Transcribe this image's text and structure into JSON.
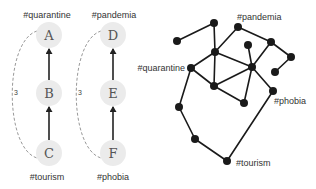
{
  "chains": [
    {
      "id": "left-chain",
      "distance_label": "3",
      "top_tag": "#quarantine",
      "bottom_tag": "#tourism",
      "nodes": [
        {
          "letter": "A",
          "x": 49,
          "y": 35
        },
        {
          "letter": "B",
          "x": 49,
          "y": 93
        },
        {
          "letter": "C",
          "x": 49,
          "y": 153
        }
      ],
      "tag_top_pos": {
        "x": 47,
        "y": 18
      },
      "tag_bottom_pos": {
        "x": 47,
        "y": 180
      },
      "dist_pos": {
        "x": 16,
        "y": 95
      },
      "arc": {
        "x_top": 37,
        "y_top": 31,
        "x_ctrl": 4,
        "y_mid": 93,
        "x_bottom": 37,
        "y_bottom": 158
      }
    },
    {
      "id": "right-chain",
      "distance_label": "3",
      "top_tag": "#pandemia",
      "bottom_tag": "#phobia",
      "nodes": [
        {
          "letter": "D",
          "x": 113,
          "y": 35
        },
        {
          "letter": "E",
          "x": 113,
          "y": 93
        },
        {
          "letter": "F",
          "x": 113,
          "y": 153
        }
      ],
      "tag_top_pos": {
        "x": 114,
        "y": 18
      },
      "tag_bottom_pos": {
        "x": 113,
        "y": 180
      },
      "dist_pos": {
        "x": 80,
        "y": 95
      },
      "arc": {
        "x_top": 101,
        "y_top": 31,
        "x_ctrl": 68,
        "y_mid": 93,
        "x_bottom": 101,
        "y_bottom": 158
      }
    }
  ],
  "node_style": {
    "fill": "#ebebeb",
    "radius": 13,
    "arrow_color": "#222222",
    "dash_color": "#999999"
  },
  "graph": {
    "node_radius": 4,
    "node_color": "#1a1a1a",
    "edge_color": "#1a1a1a",
    "nodes": [
      {
        "id": "n1",
        "x": 177,
        "y": 41
      },
      {
        "id": "n2",
        "x": 214,
        "y": 23
      },
      {
        "id": "n3",
        "x": 238,
        "y": 27,
        "tag": "#pandemia"
      },
      {
        "id": "n4",
        "x": 215,
        "y": 52
      },
      {
        "id": "n5",
        "x": 248,
        "y": 45
      },
      {
        "id": "n6",
        "x": 271,
        "y": 42
      },
      {
        "id": "n7",
        "x": 291,
        "y": 57
      },
      {
        "id": "n8",
        "x": 275,
        "y": 72
      },
      {
        "id": "n9",
        "x": 191,
        "y": 68,
        "tag": "#quarantine"
      },
      {
        "id": "n10",
        "x": 252,
        "y": 67
      },
      {
        "id": "n11",
        "x": 214,
        "y": 86
      },
      {
        "id": "n12",
        "x": 273,
        "y": 91,
        "tag": "#phobia"
      },
      {
        "id": "n13",
        "x": 244,
        "y": 103
      },
      {
        "id": "n14",
        "x": 179,
        "y": 107
      },
      {
        "id": "n15",
        "x": 195,
        "y": 139
      },
      {
        "id": "n16",
        "x": 227,
        "y": 161,
        "tag": "#tourism"
      }
    ],
    "edges": [
      [
        "n1",
        "n2"
      ],
      [
        "n2",
        "n4"
      ],
      [
        "n3",
        "n4"
      ],
      [
        "n3",
        "n6"
      ],
      [
        "n6",
        "n7"
      ],
      [
        "n7",
        "n8"
      ],
      [
        "n6",
        "n10"
      ],
      [
        "n5",
        "n10"
      ],
      [
        "n4",
        "n10"
      ],
      [
        "n4",
        "n9"
      ],
      [
        "n4",
        "n11"
      ],
      [
        "n9",
        "n11"
      ],
      [
        "n11",
        "n10"
      ],
      [
        "n11",
        "n13"
      ],
      [
        "n10",
        "n13"
      ],
      [
        "n10",
        "n12"
      ],
      [
        "n9",
        "n14"
      ],
      [
        "n14",
        "n15"
      ],
      [
        "n15",
        "n16"
      ],
      [
        "n16",
        "n12"
      ]
    ],
    "labels": [
      {
        "text": "#pandemia",
        "x": 237,
        "y": 20,
        "anchor": "start"
      },
      {
        "text": "#quarantine",
        "x": 185,
        "y": 71,
        "anchor": "end"
      },
      {
        "text": "#phobia",
        "x": 274,
        "y": 104,
        "anchor": "start"
      },
      {
        "text": "#tourism",
        "x": 236,
        "y": 166,
        "anchor": "start"
      }
    ]
  }
}
